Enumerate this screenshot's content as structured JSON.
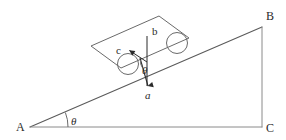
{
  "figure": {
    "background_color": "#ffffff",
    "line_color": "#5a5a5a",
    "label_color": "#2b2b2b"
  },
  "triangle": {
    "name": "inclined-plane-triangle",
    "vertices": [
      {
        "id": "A",
        "label": "A",
        "role": "incline-base-left",
        "x": 30,
        "y": 127
      },
      {
        "id": "B",
        "label": "B",
        "role": "incline-apex-top-right",
        "x": 262,
        "y": 27
      },
      {
        "id": "C",
        "label": "C",
        "role": "right-angle-corner",
        "x": 262,
        "y": 127
      }
    ],
    "sides": [
      {
        "id": "AB",
        "role": "incline-surface"
      },
      {
        "id": "BC",
        "role": "vertical-side"
      },
      {
        "id": "AC",
        "role": "horizontal-base"
      }
    ]
  },
  "angles": [
    {
      "id": "theta-base",
      "label": "θ",
      "at_vertex": "A",
      "description": "incline angle between base AC and surface AB"
    },
    {
      "id": "theta-cart",
      "label": "θ",
      "at_vertex": "cart",
      "description": "angle between vertical reference b and vector a"
    }
  ],
  "cart": {
    "name": "cart-on-incline",
    "body_label": "",
    "wheels": [
      {
        "id": "wheel-rear",
        "position": "lower-left"
      },
      {
        "id": "wheel-front",
        "position": "upper-right"
      }
    ]
  },
  "vectors": [
    {
      "id": "a",
      "label": "a",
      "style": "italic",
      "direction": "downward",
      "description": "vector pointing straight down from the cart"
    },
    {
      "id": "b",
      "label": "b",
      "style": "upright",
      "direction": "vertical-reference",
      "description": "vertical reference line above the cart"
    },
    {
      "id": "c",
      "label": "c",
      "style": "upright",
      "direction": "up-the-incline-left",
      "description": "vector pointing along the incline toward A"
    }
  ]
}
